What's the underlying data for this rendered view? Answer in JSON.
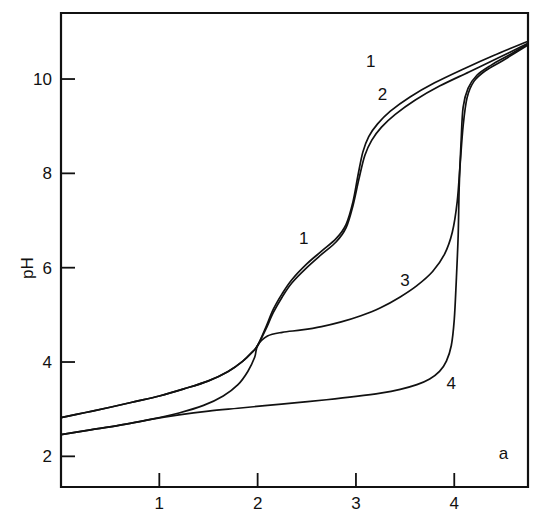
{
  "chart_data": {
    "type": "line",
    "title": "",
    "xlabel": "a",
    "ylabel": "pH",
    "xlim": [
      0.0,
      4.75
    ],
    "ylim": [
      1.35,
      11.4
    ],
    "grid": false,
    "legend": "inline-curve-labels",
    "xticks": [
      1,
      2,
      3,
      4
    ],
    "xtick_labels": [
      "1",
      "2",
      "3",
      "4"
    ],
    "yticks": [
      2,
      4,
      6,
      8,
      10
    ],
    "ytick_labels": [
      "2",
      "4",
      "6",
      "8",
      "10"
    ],
    "annotations": [
      {
        "text": "1",
        "x": 2.47,
        "y": 6.5
      },
      {
        "text": "1",
        "x": 3.15,
        "y": 10.25
      },
      {
        "text": "2",
        "x": 3.27,
        "y": 9.55
      },
      {
        "text": "3",
        "x": 3.5,
        "y": 5.62
      },
      {
        "text": "4",
        "x": 3.97,
        "y": 3.42
      },
      {
        "text": "a",
        "x": 4.5,
        "y": 1.95
      }
    ],
    "series": [
      {
        "name": "1",
        "label": "1",
        "points": [
          [
            0.0,
            2.82
          ],
          [
            0.25,
            2.93
          ],
          [
            0.5,
            3.04
          ],
          [
            0.75,
            3.16
          ],
          [
            1.0,
            3.28
          ],
          [
            1.25,
            3.43
          ],
          [
            1.5,
            3.6
          ],
          [
            1.7,
            3.8
          ],
          [
            1.85,
            4.02
          ],
          [
            1.95,
            4.22
          ],
          [
            2.0,
            4.35
          ],
          [
            2.08,
            4.72
          ],
          [
            2.16,
            5.12
          ],
          [
            2.25,
            5.45
          ],
          [
            2.35,
            5.75
          ],
          [
            2.5,
            6.08
          ],
          [
            2.65,
            6.35
          ],
          [
            2.8,
            6.62
          ],
          [
            2.9,
            6.92
          ],
          [
            2.97,
            7.4
          ],
          [
            3.02,
            7.95
          ],
          [
            3.07,
            8.45
          ],
          [
            3.13,
            8.78
          ],
          [
            3.22,
            9.05
          ],
          [
            3.35,
            9.32
          ],
          [
            3.55,
            9.62
          ],
          [
            3.8,
            9.92
          ],
          [
            4.1,
            10.22
          ],
          [
            4.4,
            10.5
          ],
          [
            4.75,
            10.8
          ]
        ]
      },
      {
        "name": "2",
        "label": "2",
        "points": [
          [
            0.0,
            2.82
          ],
          [
            0.25,
            2.93
          ],
          [
            0.5,
            3.04
          ],
          [
            0.75,
            3.16
          ],
          [
            1.0,
            3.28
          ],
          [
            1.25,
            3.43
          ],
          [
            1.5,
            3.6
          ],
          [
            1.7,
            3.8
          ],
          [
            1.85,
            4.02
          ],
          [
            1.95,
            4.22
          ],
          [
            2.0,
            4.35
          ],
          [
            2.08,
            4.68
          ],
          [
            2.16,
            5.05
          ],
          [
            2.25,
            5.38
          ],
          [
            2.35,
            5.68
          ],
          [
            2.5,
            6.0
          ],
          [
            2.65,
            6.28
          ],
          [
            2.8,
            6.55
          ],
          [
            2.9,
            6.85
          ],
          [
            2.97,
            7.32
          ],
          [
            3.03,
            7.88
          ],
          [
            3.09,
            8.38
          ],
          [
            3.16,
            8.7
          ],
          [
            3.26,
            8.98
          ],
          [
            3.4,
            9.25
          ],
          [
            3.6,
            9.55
          ],
          [
            3.85,
            9.85
          ],
          [
            4.15,
            10.15
          ],
          [
            4.45,
            10.45
          ],
          [
            4.75,
            10.76
          ]
        ]
      },
      {
        "name": "3",
        "label": "3",
        "points": [
          [
            0.0,
            2.46
          ],
          [
            0.3,
            2.56
          ],
          [
            0.6,
            2.66
          ],
          [
            0.9,
            2.78
          ],
          [
            1.2,
            2.92
          ],
          [
            1.45,
            3.08
          ],
          [
            1.65,
            3.28
          ],
          [
            1.8,
            3.52
          ],
          [
            1.9,
            3.8
          ],
          [
            1.97,
            4.1
          ],
          [
            2.0,
            4.35
          ],
          [
            2.1,
            4.55
          ],
          [
            2.25,
            4.63
          ],
          [
            2.45,
            4.68
          ],
          [
            2.65,
            4.75
          ],
          [
            2.85,
            4.85
          ],
          [
            3.05,
            4.98
          ],
          [
            3.25,
            5.15
          ],
          [
            3.45,
            5.38
          ],
          [
            3.62,
            5.62
          ],
          [
            3.78,
            5.92
          ],
          [
            3.9,
            6.28
          ],
          [
            3.98,
            6.75
          ],
          [
            4.03,
            7.4
          ],
          [
            4.06,
            8.2
          ],
          [
            4.09,
            9.0
          ],
          [
            4.13,
            9.6
          ],
          [
            4.2,
            9.95
          ],
          [
            4.32,
            10.18
          ],
          [
            4.5,
            10.4
          ],
          [
            4.75,
            10.72
          ]
        ]
      },
      {
        "name": "4",
        "label": "4",
        "points": [
          [
            0.0,
            2.46
          ],
          [
            0.3,
            2.56
          ],
          [
            0.6,
            2.66
          ],
          [
            0.9,
            2.78
          ],
          [
            1.2,
            2.88
          ],
          [
            1.5,
            2.96
          ],
          [
            1.8,
            3.02
          ],
          [
            2.1,
            3.08
          ],
          [
            2.4,
            3.14
          ],
          [
            2.7,
            3.2
          ],
          [
            3.0,
            3.27
          ],
          [
            3.25,
            3.34
          ],
          [
            3.45,
            3.42
          ],
          [
            3.62,
            3.52
          ],
          [
            3.75,
            3.64
          ],
          [
            3.85,
            3.8
          ],
          [
            3.92,
            4.02
          ],
          [
            3.97,
            4.35
          ],
          [
            4.0,
            4.9
          ],
          [
            4.02,
            5.7
          ],
          [
            4.04,
            6.7
          ],
          [
            4.05,
            7.7
          ],
          [
            4.07,
            8.7
          ],
          [
            4.09,
            9.4
          ],
          [
            4.14,
            9.8
          ],
          [
            4.23,
            10.08
          ],
          [
            4.38,
            10.3
          ],
          [
            4.55,
            10.5
          ],
          [
            4.75,
            10.74
          ]
        ]
      }
    ]
  }
}
